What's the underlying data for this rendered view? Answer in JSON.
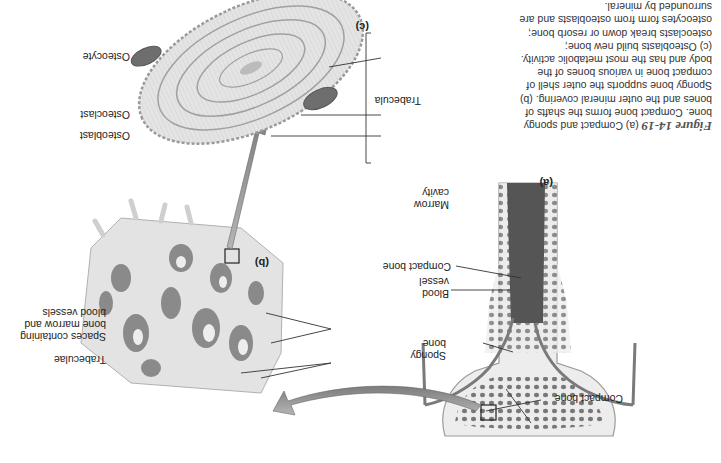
{
  "figure": {
    "number": "Figure 14-19",
    "caption": {
      "a": "(a) Compact and spongy bone. Compact bone forms the shafts of bones and the outer mineral covering.",
      "b": "(b) Spongy bone supports the outer shell of compact bone in various bones of the body and has the most metabolic activity.",
      "c": "(c) Osteoblasts build new bone; osteoclasts break down or resorb bone; osteocytes form from osteoblasts and are surrounded by mineral."
    },
    "orientation": "rotated 180 degrees"
  },
  "panel_a": {
    "letter": "(a)",
    "labels": {
      "compact_bone_top": "Compact bone",
      "marrow_cavity_1": "Marrow",
      "marrow_cavity_2": "cavity",
      "blood_vessel_1": "Blood",
      "blood_vessel_2": "vessel",
      "spongy_bone_1": "Spongy",
      "spongy_bone_2": "bone",
      "compact_bone_bottom": "Compact bone"
    }
  },
  "panel_b": {
    "letter": "(b)",
    "labels": {
      "spaces_1": "Spaces containing",
      "spaces_2": "bone marrow and",
      "spaces_3": "blood vessels",
      "trabeculae": "Trabeculae"
    }
  },
  "panel_c": {
    "letter": "(c)",
    "labels": {
      "osteoblast": "Osteoblast",
      "osteoclast": "Osteoclast",
      "osteocyte": "Osteocyte",
      "trabecula": "Trabecula"
    }
  },
  "colors": {
    "bone": "#e6e6e6",
    "bone_shadow": "#a8a8a8",
    "marrow": "#5a5a5a",
    "vessel": "#7a7a7a",
    "arrow": "#8c8c8c",
    "osteoclast": "#6e6e6e"
  }
}
